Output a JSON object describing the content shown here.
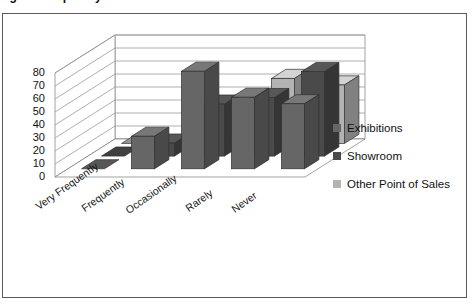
{
  "page": {
    "title_clipped": "ng the frequency"
  },
  "legend": {
    "position": "right",
    "items": [
      {
        "label": "Exhibitions",
        "color": "#666666"
      },
      {
        "label": "Showroom",
        "color": "#4a4a4a"
      },
      {
        "label": "Other Point of Sales",
        "color": "#b3b3b3"
      }
    ]
  },
  "chart_data": {
    "type": "bar",
    "subtype": "3d-clustered-column",
    "title": "",
    "xlabel": "",
    "ylabel": "",
    "ylim": [
      0,
      80
    ],
    "yticks": [
      0,
      10,
      20,
      30,
      40,
      50,
      60,
      70,
      80
    ],
    "grid": true,
    "categories": [
      "Very Frequently",
      "Frequently",
      "Occasionally",
      "Rarely",
      "Never"
    ],
    "series": [
      {
        "name": "Exhibitions",
        "color": "#666666",
        "values": [
          0,
          25,
          75,
          55,
          50
        ]
      },
      {
        "name": "Showroom",
        "color": "#4a4a4a",
        "values": [
          0,
          10,
          40,
          45,
          65
        ]
      },
      {
        "name": "Other Point of Sales",
        "color": "#b3b3b3",
        "values": [
          0,
          0,
          25,
          50,
          45
        ]
      }
    ]
  }
}
